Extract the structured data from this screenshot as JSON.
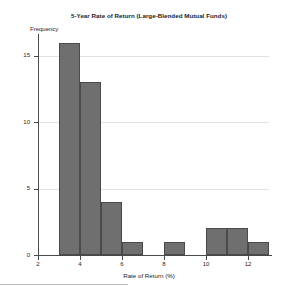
{
  "chart_data": {
    "type": "bar",
    "title": "5-Year Rate of Return (Large-Blended Mutual Funds)",
    "xlabel": "Rate of Return (%)",
    "ylabel": "Frequency",
    "grid": true,
    "legend": null,
    "xlim": [
      2,
      13
    ],
    "ylim": [
      0,
      16.5
    ],
    "xticks": [
      2,
      4,
      6,
      8,
      10,
      12
    ],
    "xtick_labels": [
      "2",
      "4",
      "6",
      "8",
      "10",
      "12"
    ],
    "yticks": [
      0,
      5,
      10,
      15
    ],
    "ytick_labels": [
      "0",
      "5",
      "10",
      "15"
    ],
    "bin_width": 1,
    "bins": [
      {
        "left": 3,
        "right": 4,
        "value": 16
      },
      {
        "left": 4,
        "right": 5,
        "value": 13
      },
      {
        "left": 5,
        "right": 6,
        "value": 4
      },
      {
        "left": 6,
        "right": 7,
        "value": 1
      },
      {
        "left": 7,
        "right": 8,
        "value": 0
      },
      {
        "left": 8,
        "right": 9,
        "value": 1
      },
      {
        "left": 9,
        "right": 10,
        "value": 0
      },
      {
        "left": 10,
        "right": 11,
        "value": 2
      },
      {
        "left": 11,
        "right": 12,
        "value": 2
      },
      {
        "left": 12,
        "right": 13,
        "value": 1
      }
    ],
    "categories": [
      "3-4",
      "4-5",
      "5-6",
      "6-7",
      "7-8",
      "8-9",
      "9-10",
      "10-11",
      "11-12",
      "12-13"
    ],
    "values": [
      16,
      13,
      4,
      1,
      0,
      1,
      0,
      2,
      2,
      1
    ],
    "colors": {
      "bar_fill": "#6f6f6f",
      "bar_edge": "#4a4a4a",
      "axis": "#4a4a4a",
      "grid": "#e2e2e6",
      "text": "#1c1c1c",
      "background": "#ffffff",
      "rule": "#b8b8bc"
    }
  }
}
